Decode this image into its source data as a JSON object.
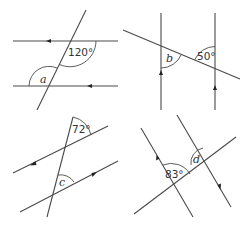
{
  "diagrams": [
    {
      "id": "top-left",
      "known_angle": "120°",
      "unknown": "a",
      "description": "Two parallel horizontal lines cut by a transversal"
    },
    {
      "id": "top-right",
      "known_angle": "50°",
      "unknown": "b",
      "description": "Two parallel vertical lines cut by a transversal"
    },
    {
      "id": "bottom-left",
      "known_angle": "72°",
      "unknown": "c",
      "description": "Two parallel slanted lines cut by a transversal"
    },
    {
      "id": "bottom-right",
      "known_angle": "83°",
      "unknown": "d",
      "description": "Two parallel slanted lines cut by a transversal"
    }
  ]
}
